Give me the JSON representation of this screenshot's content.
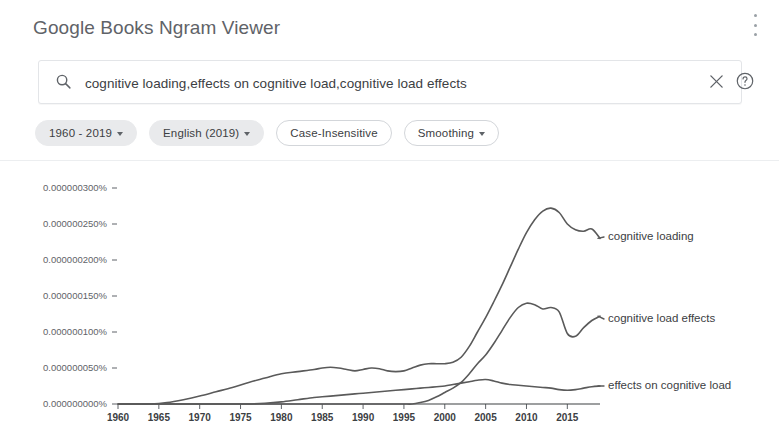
{
  "header": {
    "title": "Google Books Ngram Viewer",
    "overflow_icon": "more-vert-icon"
  },
  "search": {
    "icon": "search-icon",
    "value": "cognitive loading,effects on cognitive load,cognitive load effects",
    "placeholder": "",
    "clear_icon": "close-icon",
    "help_icon": "help-circle-icon"
  },
  "filters": [
    {
      "label": "1960 - 2019",
      "style": "filled",
      "caret": true
    },
    {
      "label": "English (2019)",
      "style": "filled",
      "caret": true
    },
    {
      "label": "Case-Insensitive",
      "style": "outlined",
      "caret": false
    },
    {
      "label": "Smoothing",
      "style": "outlined",
      "caret": true
    }
  ],
  "colors": {
    "line": "#5a5a5a",
    "axis": "#3c4043",
    "chip_filled_bg": "#e9eaec",
    "chip_outline": "#d3d6da",
    "title": "#5f6368"
  },
  "chart_data": {
    "type": "line",
    "title": "",
    "xlabel": "",
    "ylabel": "",
    "grid": false,
    "legend_position": "right-inline",
    "xlim": [
      1960,
      2019
    ],
    "ylim": [
      0.0,
      3e-07
    ],
    "xticks": [
      1960,
      1965,
      1970,
      1975,
      1980,
      1985,
      1990,
      1995,
      2000,
      2005,
      2010,
      2015
    ],
    "yticks": [
      0.0,
      5e-08,
      1e-07,
      1.5e-07,
      2e-07,
      2.5e-07,
      3e-07
    ],
    "ytick_labels": [
      "0.000000000%",
      "0.000000050%",
      "0.000000100%",
      "0.000000150%",
      "0.000000200%",
      "0.000000250%",
      "0.000000300%"
    ],
    "x": [
      1960,
      1962,
      1964,
      1966,
      1968,
      1970,
      1972,
      1974,
      1976,
      1978,
      1980,
      1982,
      1984,
      1985,
      1986,
      1987,
      1988,
      1989,
      1990,
      1991,
      1992,
      1993,
      1994,
      1995,
      1996,
      1997,
      1998,
      1999,
      2000,
      2001,
      2002,
      2003,
      2004,
      2005,
      2006,
      2007,
      2008,
      2009,
      2010,
      2011,
      2012,
      2013,
      2014,
      2015,
      2016,
      2017,
      2018,
      2019
    ],
    "series": [
      {
        "name": "cognitive loading",
        "values": [
          0.0,
          0.0,
          0.0,
          2e-09,
          6e-09,
          1.1e-08,
          1.7e-08,
          2.3e-08,
          3e-08,
          3.6e-08,
          4.2e-08,
          4.5e-08,
          4.8e-08,
          5e-08,
          5.1e-08,
          5e-08,
          4.8e-08,
          4.6e-08,
          4.8e-08,
          5e-08,
          4.9e-08,
          4.6e-08,
          4.5e-08,
          4.6e-08,
          5e-08,
          5.4e-08,
          5.6e-08,
          5.6e-08,
          5.6e-08,
          5.8e-08,
          6.5e-08,
          8e-08,
          1e-07,
          1.2e-07,
          1.42e-07,
          1.65e-07,
          1.9e-07,
          2.15e-07,
          2.38e-07,
          2.56e-07,
          2.68e-07,
          2.72e-07,
          2.66e-07,
          2.5e-07,
          2.42e-07,
          2.4e-07,
          2.43e-07,
          2.3e-07
        ]
      },
      {
        "name": "cognitive load effects",
        "values": [
          0.0,
          0.0,
          0.0,
          0.0,
          0.0,
          0.0,
          0.0,
          0.0,
          0.0,
          0.0,
          0.0,
          0.0,
          0.0,
          0.0,
          0.0,
          0.0,
          0.0,
          0.0,
          0.0,
          0.0,
          0.0,
          0.0,
          0.0,
          0.0,
          0.0,
          2e-09,
          5e-09,
          1e-08,
          1.6e-08,
          2.2e-08,
          3e-08,
          4.2e-08,
          5.6e-08,
          6.8e-08,
          8.4e-08,
          1.02e-07,
          1.2e-07,
          1.34e-07,
          1.4e-07,
          1.38e-07,
          1.32e-07,
          1.34e-07,
          1.28e-07,
          9.8e-08,
          9.4e-08,
          1.06e-07,
          1.16e-07,
          1.22e-07
        ]
      },
      {
        "name": "effects on cognitive load",
        "values": [
          0.0,
          0.0,
          0.0,
          0.0,
          0.0,
          0.0,
          0.0,
          0.0,
          0.0,
          1e-09,
          3e-09,
          6e-09,
          9e-09,
          1e-08,
          1.1e-08,
          1.2e-08,
          1.3e-08,
          1.4e-08,
          1.5e-08,
          1.6e-08,
          1.7e-08,
          1.8e-08,
          1.9e-08,
          2e-08,
          2.1e-08,
          2.2e-08,
          2.3e-08,
          2.4e-08,
          2.5e-08,
          2.7e-08,
          2.9e-08,
          3.1e-08,
          3.3e-08,
          3.4e-08,
          3.2e-08,
          2.9e-08,
          2.7e-08,
          2.6e-08,
          2.5e-08,
          2.4e-08,
          2.3e-08,
          2.2e-08,
          2e-08,
          1.9e-08,
          2e-08,
          2.2e-08,
          2.4e-08,
          2.5e-08
        ]
      }
    ],
    "series_label_positions": [
      {
        "name": "cognitive loading",
        "x": 608,
        "y": 236
      },
      {
        "name": "cognitive load effects",
        "x": 608,
        "y": 318
      },
      {
        "name": "effects on cognitive load",
        "x": 608,
        "y": 385
      }
    ]
  }
}
